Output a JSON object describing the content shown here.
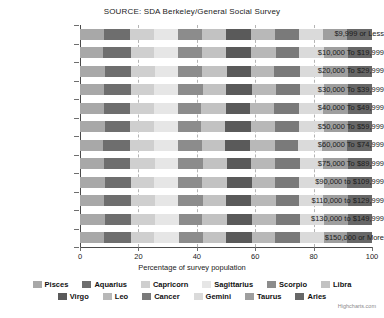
{
  "chart_data": {
    "type": "bar",
    "stacking": "percent",
    "orientation": "horizontal",
    "title": "SOURCE: SDA Berkeley/General Social Survey",
    "xlabel": "Percentage of survey population",
    "ylabel": "",
    "xlim": [
      0,
      100
    ],
    "xticks": [
      "0",
      "20",
      "40",
      "60",
      "80",
      "100"
    ],
    "grid": "vertical-dashed",
    "legend_position": "bottom",
    "credit": "Highcharts.com",
    "categories": [
      "$9,999 or Less",
      "$10,000 To $19,999",
      "$20,000 To $29,999",
      "$30,000 To $39,999",
      "$40,000 To $49,999",
      "$50,000 To $59,999",
      "$60,000 To $74,999",
      "$75,000 To $89,999",
      "$90,000 to $109,999",
      "$110,000 to $129,999",
      "$130,000 to $149,999",
      "$150,000 or More"
    ],
    "series": [
      {
        "name": "Pisces",
        "color": "#a8a8a8",
        "values": [
          8.2,
          8.0,
          8.6,
          8.3,
          8.1,
          8.4,
          8.0,
          8.3,
          8.5,
          8.1,
          8.6,
          8.3
        ]
      },
      {
        "name": "Aquarius",
        "color": "#6e6e6e",
        "values": [
          9.0,
          9.4,
          8.8,
          9.1,
          8.9,
          8.6,
          9.2,
          8.8,
          9.0,
          9.3,
          8.7,
          9.1
        ]
      },
      {
        "name": "Capricorn",
        "color": "#cfcfcf",
        "values": [
          8.1,
          7.9,
          8.3,
          8.0,
          8.4,
          8.2,
          8.1,
          8.5,
          7.9,
          8.2,
          8.4,
          8.0
        ]
      },
      {
        "name": "Sagittarius",
        "color": "#e6e6e6",
        "values": [
          8.4,
          8.1,
          7.8,
          8.2,
          8.0,
          8.3,
          8.1,
          7.9,
          8.3,
          8.0,
          8.2,
          8.4
        ]
      },
      {
        "name": "Scorpio",
        "color": "#8c8c8c",
        "values": [
          8.0,
          8.5,
          8.2,
          8.4,
          8.1,
          8.0,
          8.3,
          8.6,
          8.1,
          8.4,
          8.0,
          8.2
        ]
      },
      {
        "name": "Libra",
        "color": "#c2c2c2",
        "values": [
          8.3,
          8.0,
          8.5,
          8.1,
          8.6,
          8.3,
          8.0,
          8.2,
          8.4,
          8.1,
          8.5,
          8.0
        ]
      },
      {
        "name": "Virgo",
        "color": "#5a5a5a",
        "values": [
          8.6,
          8.8,
          8.4,
          8.7,
          8.3,
          8.9,
          8.5,
          8.2,
          8.7,
          8.4,
          8.6,
          8.8
        ]
      },
      {
        "name": "Leo",
        "color": "#b8b8b8",
        "values": [
          8.1,
          8.3,
          8.0,
          8.4,
          8.2,
          8.1,
          8.5,
          8.3,
          8.0,
          8.6,
          8.2,
          8.1
        ]
      },
      {
        "name": "Cancer",
        "color": "#7a7a7a",
        "values": [
          8.4,
          8.1,
          8.6,
          8.2,
          8.5,
          8.3,
          8.1,
          8.4,
          8.2,
          8.0,
          8.3,
          8.5
        ]
      },
      {
        "name": "Gemini",
        "color": "#dadada",
        "values": [
          8.2,
          8.4,
          8.1,
          8.3,
          8.0,
          8.5,
          8.2,
          8.1,
          8.4,
          8.3,
          8.0,
          8.2
        ]
      },
      {
        "name": "Taurus",
        "color": "#9e9e9e",
        "values": [
          8.3,
          8.2,
          8.4,
          8.0,
          8.6,
          8.1,
          8.3,
          8.5,
          8.1,
          8.4,
          8.2,
          8.0
        ]
      },
      {
        "name": "Aries",
        "color": "#676767",
        "values": [
          8.4,
          8.3,
          8.3,
          8.3,
          8.3,
          8.3,
          8.7,
          8.2,
          8.4,
          8.2,
          8.3,
          8.4
        ]
      }
    ]
  },
  "legend": {
    "rows": [
      [
        "Pisces",
        "Aquarius",
        "Capricorn",
        "Sagittarius",
        "Scorpio",
        "Libra"
      ],
      [
        "Virgo",
        "Leo",
        "Cancer",
        "Gemini",
        "Taurus",
        "Aries"
      ]
    ]
  }
}
